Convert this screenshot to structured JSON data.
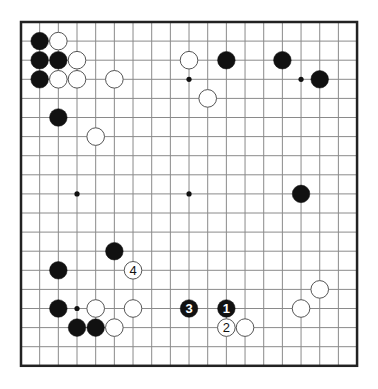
{
  "board": {
    "size": 19,
    "origin_x": 21,
    "origin_y": 22,
    "spacing_x": 18.67,
    "spacing_y": 19.1,
    "line_color": "#8a8a8a",
    "border_color": "#222222",
    "stone_black": "#111111",
    "stone_white": "#ffffff",
    "stone_outline": "#555555",
    "star_points": [
      [
        3,
        3
      ],
      [
        9,
        3
      ],
      [
        15,
        3
      ],
      [
        3,
        9
      ],
      [
        9,
        9
      ],
      [
        15,
        9
      ],
      [
        3,
        15
      ],
      [
        9,
        15
      ],
      [
        15,
        15
      ]
    ]
  },
  "stones": [
    {
      "color": "black",
      "col": 1,
      "row": 1,
      "label": ""
    },
    {
      "color": "white",
      "col": 2,
      "row": 1,
      "label": ""
    },
    {
      "color": "black",
      "col": 1,
      "row": 2,
      "label": ""
    },
    {
      "color": "black",
      "col": 2,
      "row": 2,
      "label": ""
    },
    {
      "color": "white",
      "col": 3,
      "row": 2,
      "label": ""
    },
    {
      "color": "black",
      "col": 1,
      "row": 3,
      "label": ""
    },
    {
      "color": "white",
      "col": 2,
      "row": 3,
      "label": ""
    },
    {
      "color": "white",
      "col": 3,
      "row": 3,
      "label": ""
    },
    {
      "color": "white",
      "col": 5,
      "row": 3,
      "label": ""
    },
    {
      "color": "black",
      "col": 2,
      "row": 5,
      "label": ""
    },
    {
      "color": "white",
      "col": 4,
      "row": 6,
      "label": ""
    },
    {
      "color": "white",
      "col": 9,
      "row": 2,
      "label": ""
    },
    {
      "color": "black",
      "col": 11,
      "row": 2,
      "label": ""
    },
    {
      "color": "black",
      "col": 14,
      "row": 2,
      "label": ""
    },
    {
      "color": "black",
      "col": 16,
      "row": 3,
      "label": ""
    },
    {
      "color": "white",
      "col": 10,
      "row": 4,
      "label": ""
    },
    {
      "color": "black",
      "col": 15,
      "row": 9,
      "label": ""
    },
    {
      "color": "black",
      "col": 5,
      "row": 12,
      "label": ""
    },
    {
      "color": "white",
      "col": 6,
      "row": 13,
      "label": "4"
    },
    {
      "color": "black",
      "col": 2,
      "row": 13,
      "label": ""
    },
    {
      "color": "black",
      "col": 2,
      "row": 15,
      "label": ""
    },
    {
      "color": "white",
      "col": 4,
      "row": 15,
      "label": ""
    },
    {
      "color": "white",
      "col": 6,
      "row": 15,
      "label": ""
    },
    {
      "color": "black",
      "col": 3,
      "row": 16,
      "label": ""
    },
    {
      "color": "black",
      "col": 4,
      "row": 16,
      "label": ""
    },
    {
      "color": "white",
      "col": 5,
      "row": 16,
      "label": ""
    },
    {
      "color": "black",
      "col": 9,
      "row": 15,
      "label": "3"
    },
    {
      "color": "black",
      "col": 11,
      "row": 15,
      "label": "1"
    },
    {
      "color": "white",
      "col": 11,
      "row": 16,
      "label": "2"
    },
    {
      "color": "white",
      "col": 12,
      "row": 16,
      "label": ""
    },
    {
      "color": "white",
      "col": 15,
      "row": 15,
      "label": ""
    },
    {
      "color": "white",
      "col": 16,
      "row": 14,
      "label": ""
    }
  ]
}
